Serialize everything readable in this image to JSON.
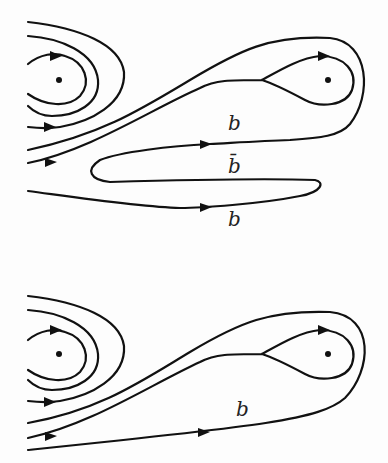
{
  "diagrams": [
    {
      "name": "top-panel",
      "labels": [
        {
          "text": "b",
          "x": 228,
          "y": 130
        },
        {
          "text": "b̄",
          "x": 228,
          "y": 173
        },
        {
          "text": "b",
          "x": 228,
          "y": 226
        }
      ]
    },
    {
      "name": "bottom-panel",
      "labels": [
        {
          "text": "b",
          "x": 236,
          "y": 416
        }
      ]
    }
  ],
  "colors": {
    "stroke": "#111111",
    "background": "#fdfdfd"
  }
}
